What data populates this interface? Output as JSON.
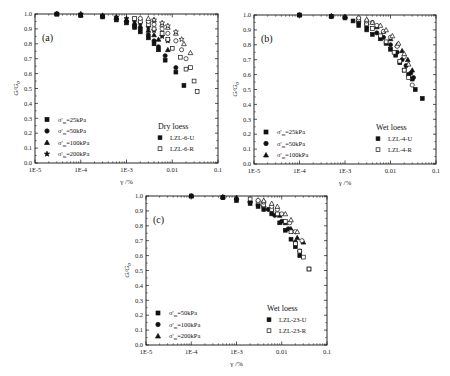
{
  "chart_data": [
    {
      "type": "scatter",
      "panel": "(a)",
      "xlabel": "γ /%",
      "ylabel": "G/G0",
      "xscale": "log",
      "xlim": [
        1e-05,
        0.1
      ],
      "ylim": [
        0.0,
        1.0
      ],
      "x_ticks": [
        "1E-5",
        "1E-4",
        "1E-3",
        "0.01",
        "0.1"
      ],
      "y_ticks": [
        "0.0",
        "0.1",
        "0.2",
        "0.3",
        "0.4",
        "0.5",
        "0.6",
        "0.7",
        "0.8",
        "0.9",
        "1.0"
      ],
      "legend_pressure": [
        "σ'm=25kPa",
        "σ'm=50kPa",
        "σ'm=100kPa",
        "σ'm=200kPa"
      ],
      "legend_title": "Dry loess",
      "legend_samples": [
        {
          "label": "LZL-6-U",
          "fill": "filled"
        },
        {
          "label": "LZL-6-R",
          "fill": "open"
        }
      ],
      "series": [
        {
          "name": "LZL-6-U σ'm=25kPa",
          "marker": "square",
          "fill": "filled",
          "x": [
            3e-05,
            0.0001,
            0.0003,
            0.0006,
            0.001,
            0.0015,
            0.002,
            0.003,
            0.004,
            0.005,
            0.007,
            0.012,
            0.018
          ],
          "y": [
            1.0,
            0.99,
            0.98,
            0.96,
            0.94,
            0.91,
            0.88,
            0.84,
            0.8,
            0.76,
            0.69,
            0.61,
            0.52
          ]
        },
        {
          "name": "LZL-6-U σ'm=50kPa",
          "marker": "circle",
          "fill": "filled",
          "x": [
            3e-05,
            0.0001,
            0.0003,
            0.0006,
            0.001,
            0.0015,
            0.002,
            0.003,
            0.004,
            0.005,
            0.007,
            0.012
          ],
          "y": [
            1.0,
            0.995,
            0.985,
            0.97,
            0.95,
            0.92,
            0.9,
            0.86,
            0.82,
            0.78,
            0.72,
            0.64
          ]
        },
        {
          "name": "LZL-6-U σ'm=100kPa",
          "marker": "triangle",
          "fill": "filled",
          "x": [
            3e-05,
            0.0001,
            0.0003,
            0.0006,
            0.001,
            0.0015,
            0.002,
            0.003,
            0.004,
            0.005,
            0.008
          ],
          "y": [
            1.0,
            0.995,
            0.99,
            0.975,
            0.96,
            0.94,
            0.92,
            0.89,
            0.86,
            0.83,
            0.76
          ]
        },
        {
          "name": "LZL-6-U σ'm=200kPa",
          "marker": "star",
          "fill": "filled",
          "x": [
            3e-05,
            0.0001,
            0.0003,
            0.0006,
            0.001,
            0.0015,
            0.002,
            0.003,
            0.004,
            0.006,
            0.008
          ],
          "y": [
            1.0,
            1.0,
            0.99,
            0.98,
            0.97,
            0.95,
            0.94,
            0.91,
            0.89,
            0.85,
            0.82
          ]
        },
        {
          "name": "LZL-6-R σ'm=25kPa",
          "marker": "square",
          "fill": "open",
          "x": [
            0.0015,
            0.002,
            0.003,
            0.004,
            0.006,
            0.008,
            0.01,
            0.015,
            0.02,
            0.025,
            0.03,
            0.035
          ],
          "y": [
            0.97,
            0.95,
            0.93,
            0.9,
            0.87,
            0.83,
            0.77,
            0.71,
            0.63,
            0.64,
            0.55,
            0.48
          ]
        },
        {
          "name": "LZL-6-R σ'm=50kPa",
          "marker": "circle",
          "fill": "open",
          "x": [
            0.002,
            0.003,
            0.004,
            0.006,
            0.008,
            0.012,
            0.016,
            0.02
          ],
          "y": [
            0.97,
            0.95,
            0.93,
            0.9,
            0.87,
            0.82,
            0.76,
            0.7
          ]
        },
        {
          "name": "LZL-6-R σ'm=100kPa",
          "marker": "triangle",
          "fill": "open",
          "x": [
            0.003,
            0.004,
            0.006,
            0.008,
            0.012,
            0.018,
            0.025
          ],
          "y": [
            0.97,
            0.96,
            0.93,
            0.91,
            0.87,
            0.8,
            0.74
          ]
        },
        {
          "name": "LZL-6-R σ'm=200kPa",
          "marker": "star",
          "fill": "open",
          "x": [
            0.004,
            0.006,
            0.008,
            0.012,
            0.016
          ],
          "y": [
            0.96,
            0.94,
            0.92,
            0.88,
            0.83
          ]
        }
      ]
    },
    {
      "type": "scatter",
      "panel": "(b)",
      "xlabel": "γ /%",
      "ylabel": "G/G0",
      "xscale": "log",
      "xlim": [
        1e-05,
        0.1
      ],
      "ylim": [
        0.0,
        1.0
      ],
      "x_ticks": [
        "1E-5",
        "1E-4",
        "1E-3",
        "0.01",
        "0.1"
      ],
      "y_ticks": [
        "0.0",
        "0.1",
        "0.2",
        "0.3",
        "0.4",
        "0.5",
        "0.6",
        "0.7",
        "0.8",
        "0.9",
        "1.0"
      ],
      "legend_pressure": [
        "σ'm=25kPa",
        "σ'm=50kPa",
        "σ'm=100kPa"
      ],
      "legend_title": "Wet loess",
      "legend_samples": [
        {
          "label": "LZL-4-U",
          "fill": "filled"
        },
        {
          "label": "LZL-4-R",
          "fill": "open"
        }
      ],
      "series": [
        {
          "name": "LZL-4-U σ'm=25kPa",
          "marker": "square",
          "fill": "filled",
          "x": [
            0.0001,
            0.0005,
            0.001,
            0.0015,
            0.002,
            0.003,
            0.004,
            0.006,
            0.008,
            0.01,
            0.013,
            0.016,
            0.02,
            0.025,
            0.03,
            0.035,
            0.05
          ],
          "y": [
            1.0,
            0.99,
            0.98,
            0.96,
            0.93,
            0.9,
            0.87,
            0.84,
            0.81,
            0.77,
            0.73,
            0.68,
            0.63,
            0.6,
            0.57,
            0.5,
            0.44
          ]
        },
        {
          "name": "LZL-4-U σ'm=50kPa",
          "marker": "circle",
          "fill": "filled",
          "x": [
            0.0001,
            0.0005,
            0.001,
            0.002,
            0.003,
            0.005,
            0.007,
            0.01,
            0.014,
            0.018,
            0.022,
            0.028,
            0.032
          ],
          "y": [
            1.0,
            0.99,
            0.985,
            0.95,
            0.92,
            0.88,
            0.85,
            0.8,
            0.75,
            0.7,
            0.66,
            0.61,
            0.58
          ]
        },
        {
          "name": "LZL-4-U σ'm=100kPa",
          "marker": "triangle",
          "fill": "filled",
          "x": [
            0.0001,
            0.0005,
            0.001,
            0.002,
            0.003,
            0.005,
            0.007,
            0.01,
            0.014,
            0.018,
            0.024,
            0.03
          ],
          "y": [
            1.0,
            0.995,
            0.99,
            0.97,
            0.95,
            0.92,
            0.89,
            0.84,
            0.8,
            0.76,
            0.7,
            0.63
          ]
        },
        {
          "name": "LZL-4-R σ'm=25kPa",
          "marker": "square",
          "fill": "open",
          "x": [
            0.002,
            0.003,
            0.004,
            0.006,
            0.008,
            0.012,
            0.016,
            0.02,
            0.025
          ],
          "y": [
            0.97,
            0.94,
            0.91,
            0.86,
            0.82,
            0.75,
            0.69,
            0.63,
            0.58
          ]
        },
        {
          "name": "LZL-4-R σ'm=50kPa",
          "marker": "circle",
          "fill": "open",
          "x": [
            0.002,
            0.003,
            0.004,
            0.005,
            0.007,
            0.01,
            0.014,
            0.02,
            0.03
          ],
          "y": [
            0.98,
            0.96,
            0.95,
            0.93,
            0.89,
            0.85,
            0.79,
            0.72,
            0.53
          ]
        },
        {
          "name": "LZL-4-R σ'm=100kPa",
          "marker": "triangle",
          "fill": "open",
          "x": [
            0.003,
            0.004,
            0.006,
            0.008,
            0.011,
            0.015,
            0.02,
            0.025
          ],
          "y": [
            0.97,
            0.95,
            0.93,
            0.9,
            0.86,
            0.81,
            0.74,
            0.67
          ]
        }
      ]
    },
    {
      "type": "scatter",
      "panel": "(c)",
      "xlabel": "γ /%",
      "ylabel": "G/G0",
      "xscale": "log",
      "xlim": [
        1e-05,
        0.1
      ],
      "ylim": [
        0.0,
        1.0
      ],
      "x_ticks": [
        "1E-5",
        "1E-4",
        "1E-3",
        "0.01",
        "0.1"
      ],
      "y_ticks": [
        "0.0",
        "0.1",
        "0.2",
        "0.3",
        "0.4",
        "0.5",
        "0.6",
        "0.7",
        "0.8",
        "0.9",
        "1.0"
      ],
      "legend_pressure": [
        "σ'm=50kPa",
        "σ'm=100kPa",
        "σ'm=200kPa"
      ],
      "legend_title": "Wet loess",
      "legend_samples": [
        {
          "label": "LZL-23-U",
          "fill": "filled"
        },
        {
          "label": "LZL-23-R",
          "fill": "open"
        }
      ],
      "series": [
        {
          "name": "LZL-23-U σ'm=50kPa",
          "marker": "square",
          "fill": "filled",
          "x": [
            0.0001,
            0.0005,
            0.001,
            0.002,
            0.003,
            0.004,
            0.006,
            0.009,
            0.012,
            0.016,
            0.02,
            0.025,
            0.04
          ],
          "y": [
            1.0,
            0.99,
            0.97,
            0.95,
            0.93,
            0.91,
            0.88,
            0.82,
            0.77,
            0.71,
            0.66,
            0.6,
            0.51
          ]
        },
        {
          "name": "LZL-23-U σ'm=100kPa",
          "marker": "circle",
          "fill": "filled",
          "x": [
            0.0001,
            0.0005,
            0.001,
            0.002,
            0.003,
            0.005,
            0.007,
            0.01,
            0.014,
            0.02,
            0.025
          ],
          "y": [
            1.0,
            0.99,
            0.98,
            0.96,
            0.94,
            0.91,
            0.87,
            0.83,
            0.78,
            0.69,
            0.63
          ]
        },
        {
          "name": "LZL-23-U σ'm=200kPa",
          "marker": "triangle",
          "fill": "filled",
          "x": [
            0.0001,
            0.0005,
            0.001,
            0.002,
            0.004,
            0.006,
            0.009,
            0.012,
            0.016,
            0.022,
            0.03
          ],
          "y": [
            1.0,
            0.995,
            0.99,
            0.97,
            0.94,
            0.91,
            0.87,
            0.82,
            0.78,
            0.72,
            0.69
          ]
        },
        {
          "name": "LZL-23-R σ'm=50kPa",
          "marker": "square",
          "fill": "open",
          "x": [
            0.002,
            0.003,
            0.004,
            0.006,
            0.008,
            0.012,
            0.016,
            0.02,
            0.025,
            0.03,
            0.04
          ],
          "y": [
            0.98,
            0.96,
            0.94,
            0.91,
            0.88,
            0.83,
            0.76,
            0.68,
            0.63,
            0.59,
            0.51
          ]
        },
        {
          "name": "LZL-23-R σ'm=100kPa",
          "marker": "circle",
          "fill": "open",
          "x": [
            0.003,
            0.004,
            0.006,
            0.008,
            0.01,
            0.015,
            0.02,
            0.028
          ],
          "y": [
            0.97,
            0.96,
            0.93,
            0.91,
            0.88,
            0.82,
            0.76,
            0.7
          ]
        },
        {
          "name": "LZL-23-R σ'm=200kPa",
          "marker": "triangle",
          "fill": "open",
          "x": [
            0.004,
            0.006,
            0.008,
            0.012,
            0.016,
            0.022
          ],
          "y": [
            0.97,
            0.95,
            0.93,
            0.88,
            0.84,
            0.76
          ]
        }
      ]
    }
  ],
  "layout": {
    "panels": [
      {
        "box": [
          35,
          14,
          218,
          163
        ]
      },
      {
        "box": [
          254,
          15,
          436,
          164
        ]
      },
      {
        "box": [
          146,
          196,
          327,
          345
        ]
      }
    ]
  }
}
